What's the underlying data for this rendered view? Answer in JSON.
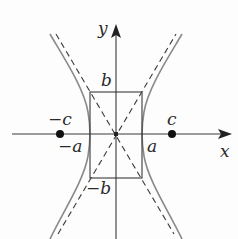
{
  "diagram": {
    "type": "hyperbola",
    "axes": {
      "x_label": "x",
      "y_label": "y"
    },
    "labels": {
      "b_top": "b",
      "b_bottom": "−b",
      "a_right": "a",
      "a_left": "−a",
      "c_right": "c",
      "c_left": "−c"
    },
    "colors": {
      "axes": "#3a3a3a",
      "curve": "#8a8a8a",
      "asymptote": "#3a3a3a",
      "rectangle": "#3a3a3a",
      "focus": "#111111"
    }
  }
}
